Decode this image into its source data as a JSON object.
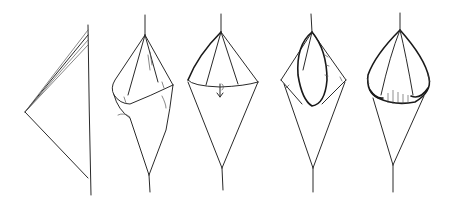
{
  "diagram": {
    "figures": [
      {
        "step": 1,
        "name": "flat-triangle"
      },
      {
        "step": 2,
        "name": "rolled-cone"
      },
      {
        "step": 3,
        "name": "cone-with-fold-arrow"
      },
      {
        "step": 4,
        "name": "cone-inner-fold"
      },
      {
        "step": 5,
        "name": "rounded-pouch"
      }
    ],
    "ink_color": "#2a2a2a",
    "background": "#ffffff"
  }
}
